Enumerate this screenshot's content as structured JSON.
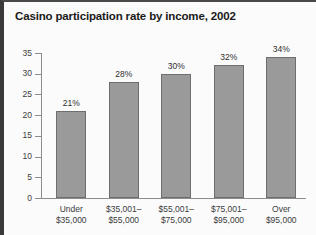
{
  "chart_data": {
    "type": "bar",
    "title": "Casino participation rate by income, 2002",
    "xlabel": "",
    "ylabel": "",
    "ylim": [
      0,
      35
    ],
    "grid": false,
    "legend": null,
    "categories": [
      "Under\n$35,000",
      "$35,001–\n$55,000",
      "$55,001–\n$75,000",
      "$75,001–\n$95,000",
      "Over\n$95,000"
    ],
    "category_lines": [
      [
        "Under",
        "$35,000"
      ],
      [
        "$35,001–",
        "$55,000"
      ],
      [
        "$55,001–",
        "$75,000"
      ],
      [
        "$75,001–",
        "$95,000"
      ],
      [
        "Over",
        "$95,000"
      ]
    ],
    "values": [
      21,
      28,
      30,
      32,
      34
    ],
    "value_labels": [
      "21%",
      "28%",
      "30%",
      "32%",
      "34%"
    ],
    "yticks": [
      0,
      5,
      10,
      15,
      20,
      25,
      30,
      35
    ],
    "ytick_labels": [
      "0",
      "5",
      "10",
      "15",
      "20",
      "25",
      "30",
      "35"
    ],
    "colors": {
      "bar_fill": "#9a9a9a",
      "bar_stroke": "#6e6e6e",
      "axis": "#8d8d8d",
      "text": "#3b3b3b",
      "title": "#1a1a1a",
      "background": "#fbfbfb",
      "border": "#3a3a3a"
    }
  }
}
